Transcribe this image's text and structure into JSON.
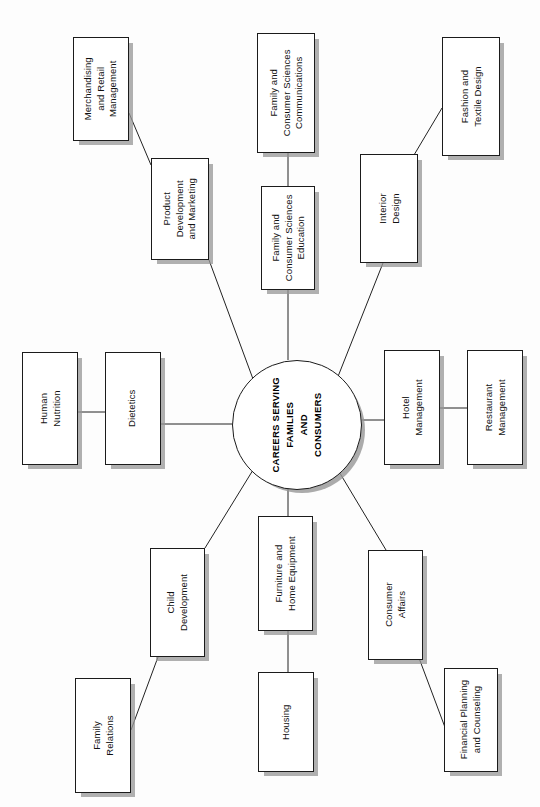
{
  "diagram": {
    "orientation": "rotated-90-ccw",
    "background_color": "#fdfdfd",
    "box_border_color": "#1b1b1b",
    "box_fill_color": "#ffffff",
    "shadow_color": "#969696",
    "connector_color": "#222222",
    "hub": {
      "id": "hub",
      "text": "CAREERS SERVING\nFAMILIES\nAND\nCONSUMERS",
      "lines": [
        "CAREERS SERVING",
        "FAMILIES",
        "AND",
        "CONSUMERS"
      ],
      "cx": 296,
      "cy": 424,
      "r": 64
    },
    "nodes": [
      {
        "id": "merchandising-and-retail-management",
        "lines": [
          "Merchandising",
          "and Retail",
          "Management"
        ],
        "x": 73,
        "y": 37,
        "w": 56,
        "h": 104
      },
      {
        "id": "product-development-and-marketing",
        "lines": [
          "Product",
          "Development",
          "and Marketing"
        ],
        "x": 151,
        "y": 158,
        "w": 58,
        "h": 102
      },
      {
        "id": "family-and-consumer-sciences-communications",
        "lines": [
          "Family and",
          "Consumer Sciences",
          "Communications"
        ],
        "x": 257,
        "y": 33,
        "w": 58,
        "h": 120
      },
      {
        "id": "family-and-consumer-sciences-education",
        "lines": [
          "Family and",
          "Consumer Sciences",
          "Education"
        ],
        "x": 261,
        "y": 186,
        "w": 54,
        "h": 104
      },
      {
        "id": "interior-design",
        "lines": [
          "Interior",
          "Design"
        ],
        "x": 360,
        "y": 154,
        "w": 58,
        "h": 109
      },
      {
        "id": "fashion-and-textile-design",
        "lines": [
          "Fashion and",
          "Textile Design"
        ],
        "x": 442,
        "y": 37,
        "w": 58,
        "h": 119
      },
      {
        "id": "human-nutrition",
        "lines": [
          "Human",
          "Nutrition"
        ],
        "x": 22,
        "y": 352,
        "w": 56,
        "h": 113
      },
      {
        "id": "dietetics",
        "lines": [
          "Dietetics"
        ],
        "x": 105,
        "y": 352,
        "w": 56,
        "h": 113
      },
      {
        "id": "hotel-management",
        "lines": [
          "Hotel",
          "Management"
        ],
        "x": 384,
        "y": 350,
        "w": 56,
        "h": 115
      },
      {
        "id": "restaurant-management",
        "lines": [
          "Restaurant",
          "Management"
        ],
        "x": 467,
        "y": 350,
        "w": 56,
        "h": 115
      },
      {
        "id": "child-development",
        "lines": [
          "Child",
          "Development"
        ],
        "x": 150,
        "y": 548,
        "w": 55,
        "h": 109
      },
      {
        "id": "family-relations",
        "lines": [
          "Family",
          "Relations"
        ],
        "x": 75,
        "y": 678,
        "w": 56,
        "h": 115
      },
      {
        "id": "furniture-and-home-equipment",
        "lines": [
          "Furniture and",
          "Home Equipment"
        ],
        "x": 258,
        "y": 516,
        "w": 55,
        "h": 115
      },
      {
        "id": "housing",
        "lines": [
          "Housing"
        ],
        "x": 258,
        "y": 672,
        "w": 56,
        "h": 100
      },
      {
        "id": "consumer-affairs",
        "lines": [
          "Consumer",
          "Affairs"
        ],
        "x": 368,
        "y": 550,
        "w": 55,
        "h": 110
      },
      {
        "id": "financial-planning-and-counseling",
        "lines": [
          "Financial Planning",
          "and Counseling"
        ],
        "x": 444,
        "y": 668,
        "w": 54,
        "h": 104
      }
    ],
    "edges": [
      {
        "from": "hub",
        "to": "product-development-and-marketing",
        "x1": 253,
        "y1": 379,
        "x2": 209,
        "y2": 260
      },
      {
        "from": "product-development-and-marketing",
        "to": "merchandising-and-retail-management",
        "x1": 151,
        "y1": 165,
        "x2": 129,
        "y2": 113
      },
      {
        "from": "hub",
        "to": "family-and-consumer-sciences-education",
        "x1": 288,
        "y1": 360,
        "x2": 288,
        "y2": 290
      },
      {
        "from": "family-and-consumer-sciences-education",
        "to": "family-and-consumer-sciences-communications",
        "x1": 288,
        "y1": 186,
        "x2": 288,
        "y2": 153
      },
      {
        "from": "hub",
        "to": "interior-design",
        "x1": 337,
        "y1": 379,
        "x2": 383,
        "y2": 263
      },
      {
        "from": "interior-design",
        "to": "fashion-and-textile-design",
        "x1": 414,
        "y1": 155,
        "x2": 442,
        "y2": 108
      },
      {
        "from": "hub",
        "to": "dietetics",
        "x1": 232,
        "y1": 424,
        "x2": 161,
        "y2": 424
      },
      {
        "from": "dietetics",
        "to": "human-nutrition",
        "x1": 105,
        "y1": 412,
        "x2": 78,
        "y2": 412
      },
      {
        "from": "hub",
        "to": "hotel-management",
        "x1": 360,
        "y1": 420,
        "x2": 440,
        "y2": 420
      },
      {
        "from": "hotel-management",
        "to": "restaurant-management",
        "x1": 440,
        "y1": 408,
        "x2": 467,
        "y2": 408
      },
      {
        "from": "hub",
        "to": "child-development",
        "x1": 253,
        "y1": 470,
        "x2": 205,
        "y2": 548
      },
      {
        "from": "child-development",
        "to": "family-relations",
        "x1": 158,
        "y1": 657,
        "x2": 131,
        "y2": 730
      },
      {
        "from": "hub",
        "to": "furniture-and-home-equipment",
        "x1": 288,
        "y1": 488,
        "x2": 288,
        "y2": 516
      },
      {
        "from": "furniture-and-home-equipment",
        "to": "housing",
        "x1": 288,
        "y1": 631,
        "x2": 288,
        "y2": 672
      },
      {
        "from": "hub",
        "to": "consumer-affairs",
        "x1": 338,
        "y1": 470,
        "x2": 386,
        "y2": 550
      },
      {
        "from": "consumer-affairs",
        "to": "financial-planning-and-counseling",
        "x1": 419,
        "y1": 658,
        "x2": 446,
        "y2": 730
      }
    ]
  }
}
